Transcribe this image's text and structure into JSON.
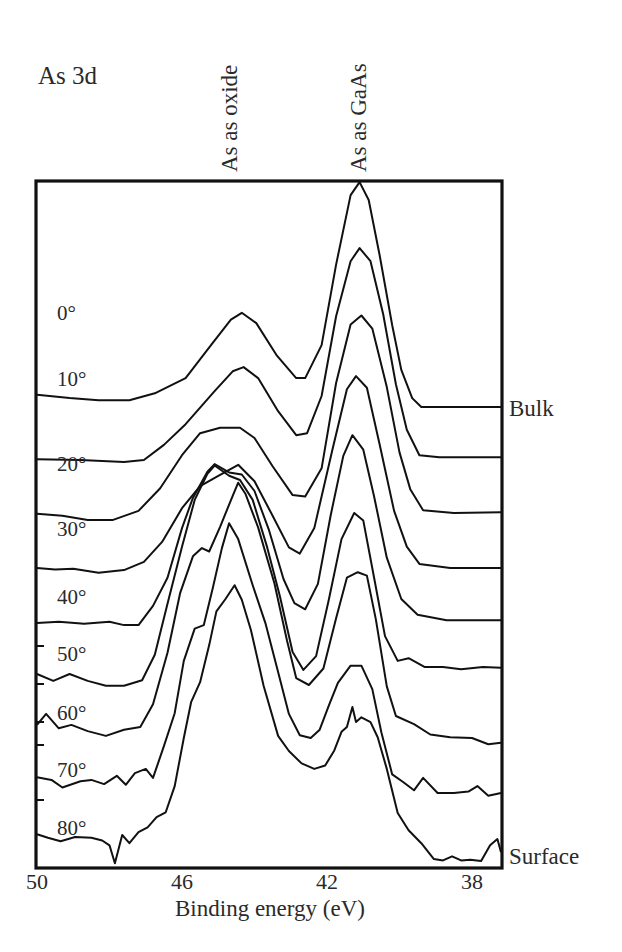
{
  "chart_data": {
    "type": "line",
    "title": "As 3d",
    "xlabel": "Binding energy (eV)",
    "ylabel": "",
    "xlim": [
      50,
      37.15
    ],
    "ylim": [
      0,
      100
    ],
    "x_reversed": true,
    "grid": false,
    "xticks": [
      50,
      46,
      42,
      38
    ],
    "xtick_labels": [
      "50",
      "46",
      "42",
      "38"
    ],
    "peak_annotations": [
      {
        "label": "As as oxide",
        "x": 44.7
      },
      {
        "label": "As as GaAs",
        "x": 41.15
      }
    ],
    "side_labels": [
      {
        "label": "Bulk",
        "series": "0°"
      },
      {
        "label": "Surface",
        "series": "80°"
      }
    ],
    "series": [
      {
        "name": "0°",
        "points": [
          [
            50.05,
            68.8
          ],
          [
            49.1,
            68.3
          ],
          [
            48.3,
            68.0
          ],
          [
            47.45,
            68.0
          ],
          [
            46.75,
            69.0
          ],
          [
            45.9,
            71.2
          ],
          [
            45.2,
            76.0
          ],
          [
            44.65,
            79.7
          ],
          [
            44.35,
            80.7
          ],
          [
            43.95,
            79.2
          ],
          [
            43.4,
            74.6
          ],
          [
            42.85,
            71.2
          ],
          [
            42.6,
            71.2
          ],
          [
            42.15,
            76.0
          ],
          [
            41.75,
            87.7
          ],
          [
            41.35,
            97.8
          ],
          [
            41.1,
            99.7
          ],
          [
            40.85,
            97.1
          ],
          [
            40.55,
            89.1
          ],
          [
            40.2,
            78.9
          ],
          [
            39.95,
            72.4
          ],
          [
            39.65,
            68.3
          ],
          [
            39.4,
            67.0
          ],
          [
            37.15,
            67.0
          ]
        ]
      },
      {
        "name": "10°",
        "points": [
          [
            50.05,
            59.4
          ],
          [
            48.8,
            59.3
          ],
          [
            47.6,
            59.0
          ],
          [
            47.05,
            59.3
          ],
          [
            46.5,
            61.5
          ],
          [
            45.9,
            64.5
          ],
          [
            45.1,
            69.3
          ],
          [
            44.6,
            72.2
          ],
          [
            44.3,
            72.8
          ],
          [
            43.9,
            71.2
          ],
          [
            43.35,
            66.4
          ],
          [
            42.85,
            62.9
          ],
          [
            42.55,
            63.2
          ],
          [
            42.15,
            68.6
          ],
          [
            41.75,
            80.2
          ],
          [
            41.35,
            88.2
          ],
          [
            41.1,
            90.1
          ],
          [
            40.8,
            88.2
          ],
          [
            40.45,
            80.5
          ],
          [
            40.1,
            70.3
          ],
          [
            39.8,
            63.7
          ],
          [
            39.45,
            60.0
          ],
          [
            38.9,
            59.7
          ],
          [
            37.15,
            59.7
          ]
        ]
      },
      {
        "name": "20°",
        "points": [
          [
            50.05,
            51.5
          ],
          [
            49.3,
            51.2
          ],
          [
            48.6,
            50.6
          ],
          [
            47.9,
            50.6
          ],
          [
            47.2,
            51.9
          ],
          [
            46.6,
            55.2
          ],
          [
            46.0,
            60.0
          ],
          [
            45.5,
            63.2
          ],
          [
            44.95,
            64.0
          ],
          [
            44.4,
            64.0
          ],
          [
            44.0,
            62.5
          ],
          [
            43.5,
            58.4
          ],
          [
            42.95,
            54.2
          ],
          [
            42.6,
            54.0
          ],
          [
            42.15,
            58.1
          ],
          [
            41.75,
            70.5
          ],
          [
            41.35,
            79.0
          ],
          [
            41.05,
            80.3
          ],
          [
            40.75,
            78.4
          ],
          [
            40.35,
            69.9
          ],
          [
            40.0,
            60.4
          ],
          [
            39.7,
            55.0
          ],
          [
            39.35,
            52.0
          ],
          [
            38.5,
            51.6
          ],
          [
            37.15,
            51.7
          ]
        ]
      },
      {
        "name": "30°",
        "points": [
          [
            50.05,
            43.6
          ],
          [
            49.5,
            43.4
          ],
          [
            49.0,
            43.5
          ],
          [
            48.3,
            42.9
          ],
          [
            47.6,
            43.3
          ],
          [
            47.05,
            44.5
          ],
          [
            46.55,
            47.4
          ],
          [
            46.0,
            52.3
          ],
          [
            45.5,
            55.5
          ],
          [
            45.0,
            57.0
          ],
          [
            44.45,
            58.6
          ],
          [
            44.0,
            56.2
          ],
          [
            43.5,
            51.2
          ],
          [
            43.05,
            46.6
          ],
          [
            42.75,
            45.7
          ],
          [
            42.35,
            49.4
          ],
          [
            41.85,
            60.8
          ],
          [
            41.45,
            69.6
          ],
          [
            41.2,
            71.5
          ],
          [
            40.9,
            69.8
          ],
          [
            40.55,
            61.6
          ],
          [
            40.15,
            51.9
          ],
          [
            39.8,
            46.7
          ],
          [
            39.45,
            44.2
          ],
          [
            38.6,
            43.6
          ],
          [
            37.15,
            43.6
          ]
        ]
      },
      {
        "name": "40°",
        "points": [
          [
            50.05,
            35.6
          ],
          [
            49.4,
            35.8
          ],
          [
            48.7,
            35.5
          ],
          [
            48.0,
            35.8
          ],
          [
            47.6,
            35.3
          ],
          [
            47.2,
            35.3
          ],
          [
            46.8,
            38.1
          ],
          [
            46.4,
            42.2
          ],
          [
            46.0,
            49.4
          ],
          [
            45.7,
            53.8
          ],
          [
            45.3,
            57.6
          ],
          [
            45.1,
            58.7
          ],
          [
            44.7,
            57.5
          ],
          [
            44.35,
            57.2
          ],
          [
            44.0,
            54.8
          ],
          [
            43.6,
            49.1
          ],
          [
            43.2,
            42.0
          ],
          [
            42.9,
            38.5
          ],
          [
            42.6,
            37.6
          ],
          [
            42.25,
            41.3
          ],
          [
            41.9,
            51.2
          ],
          [
            41.55,
            59.9
          ],
          [
            41.3,
            62.9
          ],
          [
            41.0,
            60.8
          ],
          [
            40.7,
            54.0
          ],
          [
            40.35,
            45.1
          ],
          [
            39.95,
            39.1
          ],
          [
            39.5,
            36.8
          ],
          [
            38.7,
            36.0
          ],
          [
            37.15,
            36.0
          ]
        ]
      },
      {
        "name": "50°",
        "points": [
          [
            50.05,
            28.2
          ],
          [
            49.55,
            27.2
          ],
          [
            49.1,
            28.2
          ],
          [
            48.6,
            27.2
          ],
          [
            48.1,
            26.5
          ],
          [
            47.6,
            26.5
          ],
          [
            47.1,
            27.3
          ],
          [
            46.75,
            31.0
          ],
          [
            46.4,
            38.4
          ],
          [
            46.0,
            46.7
          ],
          [
            45.65,
            53.5
          ],
          [
            45.3,
            57.3
          ],
          [
            45.1,
            58.5
          ],
          [
            44.7,
            57.0
          ],
          [
            44.4,
            56.4
          ],
          [
            44.05,
            53.5
          ],
          [
            43.65,
            46.6
          ],
          [
            43.3,
            39.5
          ],
          [
            42.95,
            31.4
          ],
          [
            42.65,
            28.8
          ],
          [
            42.3,
            30.8
          ],
          [
            41.95,
            39.0
          ],
          [
            41.6,
            47.8
          ],
          [
            41.25,
            51.6
          ],
          [
            41.0,
            50.5
          ],
          [
            40.7,
            42.2
          ],
          [
            40.4,
            33.7
          ],
          [
            40.05,
            30.1
          ],
          [
            39.75,
            30.5
          ],
          [
            39.3,
            29.2
          ],
          [
            38.8,
            29.2
          ],
          [
            38.3,
            28.9
          ],
          [
            37.7,
            29.2
          ],
          [
            37.15,
            29.1
          ]
        ]
      },
      {
        "name": "60°",
        "points": [
          [
            50.05,
            20.8
          ],
          [
            49.75,
            22.4
          ],
          [
            49.4,
            20.3
          ],
          [
            49.05,
            20.8
          ],
          [
            48.6,
            19.9
          ],
          [
            48.1,
            19.2
          ],
          [
            47.6,
            20.1
          ],
          [
            47.15,
            20.5
          ],
          [
            46.8,
            23.8
          ],
          [
            46.4,
            31.3
          ],
          [
            46.05,
            40.0
          ],
          [
            45.7,
            45.3
          ],
          [
            45.45,
            46.5
          ],
          [
            45.25,
            46.0
          ],
          [
            44.95,
            49.6
          ],
          [
            44.6,
            54.1
          ],
          [
            44.45,
            56.0
          ],
          [
            44.25,
            54.4
          ],
          [
            43.9,
            49.5
          ],
          [
            43.45,
            41.4
          ],
          [
            43.1,
            33.0
          ],
          [
            42.85,
            27.6
          ],
          [
            42.5,
            26.6
          ],
          [
            42.1,
            29.0
          ],
          [
            41.75,
            36.3
          ],
          [
            41.45,
            42.2
          ],
          [
            41.15,
            43.0
          ],
          [
            40.9,
            42.5
          ],
          [
            40.65,
            36.1
          ],
          [
            40.35,
            26.4
          ],
          [
            40.1,
            22.1
          ],
          [
            39.6,
            20.9
          ],
          [
            39.15,
            19.4
          ],
          [
            38.6,
            19.0
          ],
          [
            38.0,
            18.9
          ],
          [
            37.55,
            18.0
          ],
          [
            37.15,
            18.2
          ]
        ]
      },
      {
        "name": "70°",
        "points": [
          [
            50.05,
            13.2
          ],
          [
            49.6,
            12.8
          ],
          [
            49.3,
            11.7
          ],
          [
            48.8,
            12.6
          ],
          [
            48.5,
            12.8
          ],
          [
            48.15,
            12.2
          ],
          [
            47.8,
            13.4
          ],
          [
            47.55,
            12.1
          ],
          [
            47.3,
            13.8
          ],
          [
            47.0,
            14.4
          ],
          [
            46.8,
            13.1
          ],
          [
            46.5,
            17.7
          ],
          [
            46.2,
            22.5
          ],
          [
            45.95,
            30.1
          ],
          [
            45.65,
            34.8
          ],
          [
            45.4,
            35.3
          ],
          [
            45.15,
            40.7
          ],
          [
            44.9,
            46.5
          ],
          [
            44.7,
            50.1
          ],
          [
            44.45,
            47.8
          ],
          [
            44.05,
            41.1
          ],
          [
            43.7,
            35.6
          ],
          [
            43.35,
            28.5
          ],
          [
            43.05,
            22.4
          ],
          [
            42.75,
            19.3
          ],
          [
            42.45,
            18.9
          ],
          [
            42.2,
            20.1
          ],
          [
            41.95,
            23.6
          ],
          [
            41.7,
            26.9
          ],
          [
            41.35,
            29.4
          ],
          [
            41.05,
            29.4
          ],
          [
            40.75,
            26.0
          ],
          [
            40.5,
            19.7
          ],
          [
            40.2,
            13.6
          ],
          [
            39.9,
            12.5
          ],
          [
            39.6,
            11.3
          ],
          [
            39.35,
            13.1
          ],
          [
            38.95,
            10.9
          ],
          [
            38.5,
            10.9
          ],
          [
            38.1,
            11.1
          ],
          [
            37.85,
            11.9
          ],
          [
            37.55,
            10.5
          ],
          [
            37.15,
            10.9
          ]
        ]
      },
      {
        "name": "80°",
        "points": [
          [
            50.05,
            4.9
          ],
          [
            49.7,
            4.4
          ],
          [
            49.35,
            3.9
          ],
          [
            48.95,
            4.5
          ],
          [
            48.5,
            4.4
          ],
          [
            48.2,
            4.0
          ],
          [
            48.0,
            3.3
          ],
          [
            47.85,
            0.7
          ],
          [
            47.65,
            4.8
          ],
          [
            47.45,
            3.6
          ],
          [
            47.2,
            5.2
          ],
          [
            46.95,
            5.9
          ],
          [
            46.7,
            7.4
          ],
          [
            46.45,
            8.1
          ],
          [
            46.2,
            11.9
          ],
          [
            45.95,
            18.9
          ],
          [
            45.75,
            24.1
          ],
          [
            45.5,
            27.0
          ],
          [
            45.25,
            32.4
          ],
          [
            45.05,
            37.3
          ],
          [
            44.8,
            39.1
          ],
          [
            44.55,
            41.1
          ],
          [
            44.35,
            39.0
          ],
          [
            44.1,
            34.6
          ],
          [
            43.75,
            26.5
          ],
          [
            43.35,
            19.2
          ],
          [
            43.05,
            17.0
          ],
          [
            42.7,
            15.2
          ],
          [
            42.35,
            14.4
          ],
          [
            42.05,
            14.9
          ],
          [
            41.8,
            17.1
          ],
          [
            41.6,
            19.8
          ],
          [
            41.45,
            20.5
          ],
          [
            41.3,
            23.4
          ],
          [
            41.2,
            21.2
          ],
          [
            41.05,
            21.9
          ],
          [
            40.8,
            21.2
          ],
          [
            40.6,
            19.0
          ],
          [
            40.35,
            14.4
          ],
          [
            40.05,
            8.0
          ],
          [
            39.75,
            5.5
          ],
          [
            39.4,
            3.6
          ],
          [
            39.05,
            1.3
          ],
          [
            38.8,
            1.1
          ],
          [
            38.55,
            1.7
          ],
          [
            38.3,
            1.1
          ],
          [
            38.05,
            1.2
          ],
          [
            37.75,
            1.0
          ],
          [
            37.5,
            3.3
          ],
          [
            37.3,
            4.2
          ],
          [
            37.15,
            2.3
          ]
        ]
      }
    ]
  }
}
